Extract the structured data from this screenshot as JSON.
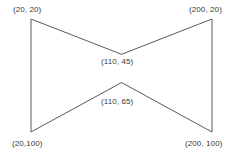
{
  "figure": {
    "name": "bowtie-polygon",
    "stroke_color": "#5a5a5a",
    "stroke_width": 1,
    "fill": "none",
    "background_color": "#ffffff",
    "text_color": "#3a3a3a"
  },
  "labels": {
    "top_left": "(20, 20)",
    "top_right": "(200, 20)",
    "mid_upper": "(110, 45)",
    "mid_lower": "(110, 65)",
    "bottom_left": "(20,100)",
    "bottom_right": "(200, 100)"
  },
  "chart_data": {
    "type": "scatter",
    "title": "",
    "xlabel": "",
    "ylabel": "",
    "vertices": [
      {
        "label": "(20, 20)",
        "x": 20,
        "y": 20
      },
      {
        "label": "(110, 45)",
        "x": 110,
        "y": 45
      },
      {
        "label": "(200, 20)",
        "x": 200,
        "y": 20
      },
      {
        "label": "(200, 100)",
        "x": 200,
        "y": 100
      },
      {
        "label": "(110, 65)",
        "x": 110,
        "y": 65
      },
      {
        "label": "(20,100)",
        "x": 20,
        "y": 100
      }
    ],
    "edges": [
      [
        "(20, 20)",
        "(110, 45)"
      ],
      [
        "(110, 45)",
        "(200, 20)"
      ],
      [
        "(200, 20)",
        "(200, 100)"
      ],
      [
        "(200, 100)",
        "(110, 65)"
      ],
      [
        "(110, 65)",
        "(20,100)"
      ],
      [
        "(20,100)",
        "(20, 20)"
      ]
    ],
    "xlim": [
      20,
      200
    ],
    "ylim": [
      20,
      100
    ],
    "grid": false,
    "legend": false
  }
}
